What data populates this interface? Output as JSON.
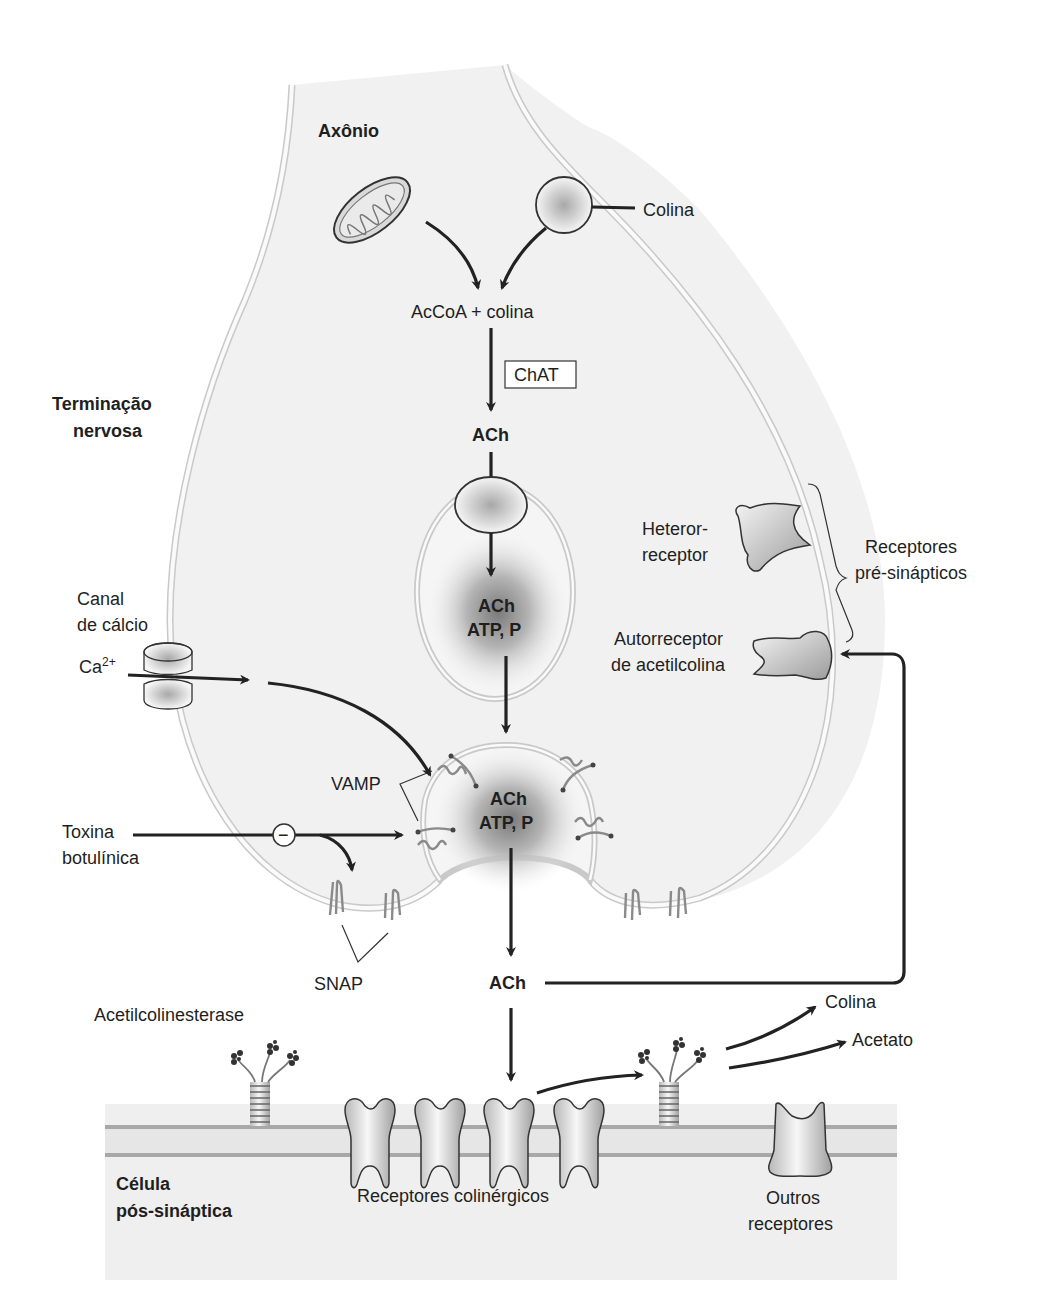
{
  "diagram": {
    "regions": {
      "axon": "Axônio",
      "nerve_terminal_line1": "Terminação",
      "nerve_terminal_line2": "nervosa",
      "postsynaptic_line1": "Célula",
      "postsynaptic_line2": "pós-sináptica"
    },
    "synthesis": {
      "choline_in": "Colina",
      "substrates": "AcCoA + colina",
      "enzyme": "ChAT",
      "product": "ACh"
    },
    "vesicles": {
      "storage_line1": "ACh",
      "storage_line2": "ATP, P",
      "docked_line1": "ACh",
      "docked_line2": "ATP, P"
    },
    "calcium": {
      "channel_line1": "Canal",
      "channel_line2": "de cálcio",
      "ion_base": "Ca",
      "ion_charge": "2+"
    },
    "snare": {
      "vamp": "VAMP",
      "snap": "SNAP"
    },
    "toxin": {
      "line1": "Toxina",
      "line2": "botulínica",
      "inhibit_symbol": "−"
    },
    "presynaptic_receptors": {
      "hetero_line1": "Heteror-",
      "hetero_line2": "receptor",
      "auto_line1": "Autorreceptor",
      "auto_line2": "de acetilcolina",
      "group_line1": "Receptores",
      "group_line2": "pré-sinápticos"
    },
    "cleft": {
      "released": "ACh",
      "enzyme": "Acetilcolinesterase",
      "product1": "Colina",
      "product2": "Acetato"
    },
    "postsynaptic": {
      "cholinergic_receptors": "Receptores colinérgicos",
      "other_line1": "Outros",
      "other_line2": "receptores"
    },
    "colors": {
      "cytoplasm": "#f1f1f1",
      "membrane": "#c9c9c9",
      "arrow": "#222222",
      "postsynaptic_band": "#d6d6d6",
      "postsynaptic_fill": "#efefef"
    }
  }
}
